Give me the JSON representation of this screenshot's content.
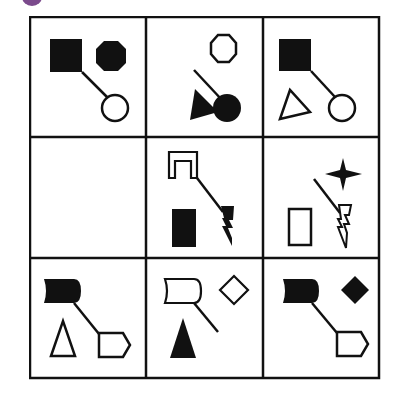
{
  "puzzle": {
    "type": "3x3 matrix reasoning",
    "badge_color": "#7b4a8c",
    "line_color": "#111111",
    "rows": [
      [
        {
          "name": "cell-r1c1",
          "shapes": [
            "filled square (connected)",
            "filled octagon",
            "hollow circle (connected)"
          ]
        },
        {
          "name": "cell-r1c2",
          "shapes": [
            "hollow octagon",
            "filled triangle",
            "filled circle (connected, stick)"
          ]
        },
        {
          "name": "cell-r1c3",
          "shapes": [
            "filled square (connected)",
            "hollow triangle",
            "hollow circle (connected)"
          ]
        }
      ],
      [
        {
          "name": "cell-r2c1",
          "shapes": [],
          "missing": true
        },
        {
          "name": "cell-r2c2",
          "shapes": [
            "hollow arch (connected)",
            "filled rectangle",
            "filled lightning (connected)"
          ]
        },
        {
          "name": "cell-r2c3",
          "shapes": [
            "filled four-point star",
            "hollow rectangle",
            "hollow lightning (connected, stick)"
          ]
        }
      ],
      [
        {
          "name": "cell-r3c1",
          "shapes": [
            "filled scroll (connected)",
            "hollow triangle",
            "hollow pentagon-arrow (connected)"
          ]
        },
        {
          "name": "cell-r3c2",
          "shapes": [
            "hollow scroll (connected, stick)",
            "hollow diamond",
            "filled triangle"
          ]
        },
        {
          "name": "cell-r3c3",
          "shapes": [
            "filled scroll (connected)",
            "filled diamond",
            "hollow pentagon-arrow (connected)"
          ]
        }
      ]
    ]
  }
}
